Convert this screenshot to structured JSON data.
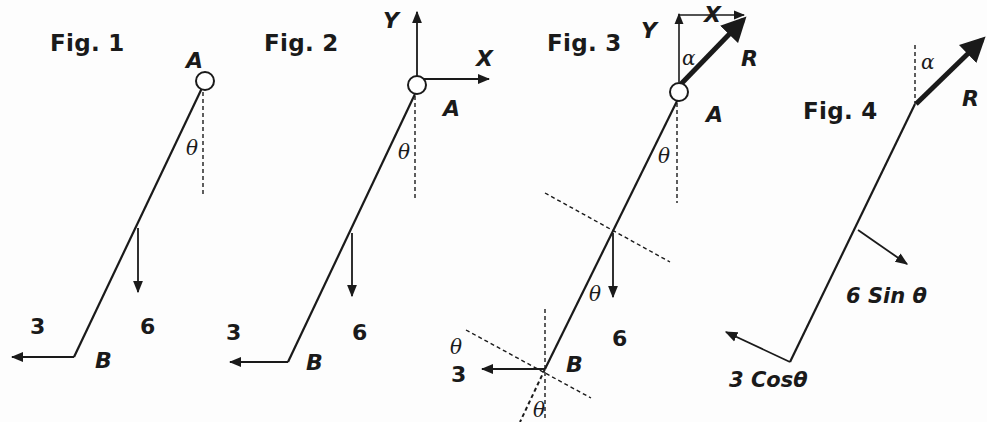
{
  "figures": [
    {
      "title": "Fig. 1",
      "labels": {
        "pivot": "A",
        "end": "B",
        "angle": "θ",
        "horizontal_force": "3",
        "weight": "6"
      }
    },
    {
      "title": "Fig. 2",
      "labels": {
        "pivot": "A",
        "end": "B",
        "angle": "θ",
        "horizontal_force": "3",
        "weight": "6",
        "x_axis": "X",
        "y_axis": "Y"
      }
    },
    {
      "title": "Fig. 3",
      "labels": {
        "pivot": "A",
        "end": "B",
        "angle_top": "θ",
        "angle_weight": "θ",
        "angle_b_upper": "θ",
        "angle_b_lower": "θ",
        "reaction_angle": "α",
        "reaction": "R",
        "horizontal_force": "3",
        "weight": "6",
        "x_axis": "X",
        "y_axis": "Y"
      }
    },
    {
      "title": "Fig. 4",
      "labels": {
        "reaction_angle": "α",
        "reaction": "R",
        "weight_component": "6 Sin θ",
        "horizontal_component": "3 Cosθ"
      }
    }
  ],
  "colors": {
    "ink": "#1a1a1a",
    "background": "#fdfdfd"
  }
}
